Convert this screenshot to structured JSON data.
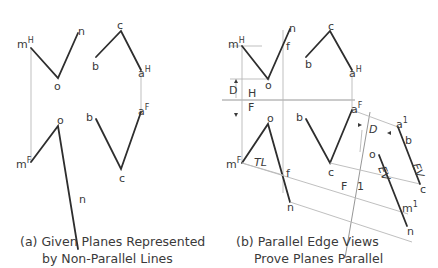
{
  "captions": {
    "a_line1": "(a) Given Planes Represented",
    "a_line2": "by Non-Parallel Lines",
    "b_line1": "(b) Parallel Edge Views",
    "b_line2": "Prove Planes Parallel"
  },
  "panel_a": {
    "labels": {
      "mH": "m",
      "mH_sup": "H",
      "nTop": "n",
      "oTop": "o",
      "bTop": "b",
      "cTop": "c",
      "aH": "a",
      "aH_sup": "H",
      "aF": "a",
      "aF_sup": "F",
      "bBot": "b",
      "oBot": "o",
      "mF": "m",
      "mF_sup": "F",
      "cBot": "c",
      "nBot": "n"
    }
  },
  "panel_b": {
    "labels": {
      "mH": "m",
      "mH_sup": "H",
      "nTop": "n",
      "fTop": "f",
      "oTop": "o",
      "bTop": "b",
      "cTop": "c",
      "aH": "a",
      "aH_sup": "H",
      "D_left": "D",
      "fold_H": "H",
      "fold_F": "F",
      "oBot": "o",
      "bBot": "b",
      "aF": "a",
      "aF_sup": "F",
      "mF": "m",
      "mF_sup": "F",
      "TL": "TL",
      "fBot": "f",
      "cBot": "c",
      "nBot": "n",
      "fold_F2": "F",
      "fold_1": "1",
      "D_right": "D",
      "a1": "a",
      "a1_sup": "1",
      "b1": "b",
      "EV1": "EV",
      "o1": "o",
      "EV2": "EV",
      "c1": "c",
      "m1": "m",
      "m1_sup": "1",
      "n1": "n"
    }
  },
  "colors": {
    "edge": "#2e2e2e",
    "projection": "#b8b8b8",
    "text": "#3a3a3a"
  }
}
